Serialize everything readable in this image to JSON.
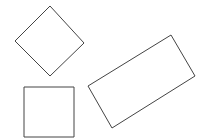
{
  "canvas": {
    "width": 204,
    "height": 138,
    "background": "#ffffff"
  },
  "stroke_color": "#444444",
  "shapes": [
    {
      "name": "diamond",
      "type": "rotated-square",
      "points": "50,6 84,43 50,76 15,41"
    },
    {
      "name": "square",
      "type": "square",
      "points": "24,87 74,87 74,137 24,137"
    },
    {
      "name": "rectangle",
      "type": "rotated-rectangle",
      "points": "171,35 195,76 112,128 88,86"
    }
  ]
}
